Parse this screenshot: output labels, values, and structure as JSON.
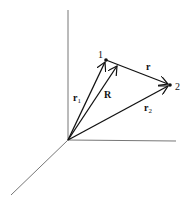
{
  "diagram": {
    "title": "",
    "colors": {
      "axis": "#777777",
      "vector": "#111111",
      "background": "#ffffff"
    },
    "origin": {
      "x": 68,
      "y": 140
    },
    "axes": [
      {
        "name": "vertical-axis",
        "x1": 68,
        "y1": 10,
        "x2": 68,
        "y2": 140
      },
      {
        "name": "horizontal-axis",
        "x1": 68,
        "y1": 140,
        "x2": 176,
        "y2": 141
      },
      {
        "name": "depth-axis",
        "x1": 68,
        "y1": 140,
        "x2": 11,
        "y2": 195
      }
    ],
    "points": [
      {
        "id": "1",
        "label": "1",
        "x": 106,
        "y": 60,
        "label_x": 98,
        "label_y": 58
      },
      {
        "id": "2",
        "label": "2",
        "x": 170,
        "y": 85,
        "label_x": 175,
        "label_y": 90
      }
    ],
    "vectors": [
      {
        "id": "r1",
        "label": "r",
        "subscript": "1",
        "from": [
          68,
          140
        ],
        "to": [
          106,
          60
        ],
        "label_x": 73,
        "label_y": 101
      },
      {
        "id": "R",
        "label": "R",
        "subscript": "",
        "from": [
          68,
          140
        ],
        "to": [
          118,
          65
        ],
        "label_x": 104,
        "label_y": 98
      },
      {
        "id": "r2",
        "label": "r",
        "subscript": "2",
        "from": [
          68,
          140
        ],
        "to": [
          170,
          85
        ],
        "label_x": 144,
        "label_y": 111
      },
      {
        "id": "r",
        "label": "r",
        "subscript": "",
        "from": [
          106,
          60
        ],
        "to": [
          170,
          85
        ],
        "label_x": 146,
        "label_y": 70
      }
    ],
    "labels": {
      "point_1": "1",
      "point_2": "2",
      "r1_main": "r",
      "r1_sub": "1",
      "R_main": "R",
      "r2_main": "r",
      "r2_sub": "2",
      "r_main": "r"
    }
  }
}
